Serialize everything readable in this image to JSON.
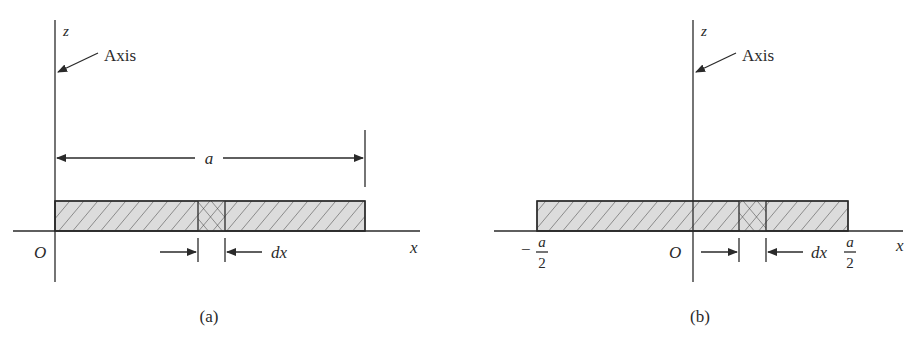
{
  "figure": {
    "panels": [
      {
        "id": "a",
        "caption": "(a)",
        "axis_callout": "Axis",
        "z_label": "z",
        "x_label": "x",
        "origin_label": "O",
        "length_label": "a",
        "element_label": "dx",
        "bar_extent": [
          "0",
          "a"
        ]
      },
      {
        "id": "b",
        "caption": "(b)",
        "axis_callout": "Axis",
        "z_label": "z",
        "x_label": "x",
        "origin_label": "O",
        "element_label": "dx",
        "left_end": {
          "sign": "−",
          "numerator": "a",
          "denominator": "2"
        },
        "right_end": {
          "numerator": "a",
          "denominator": "2"
        },
        "bar_extent": [
          "-a/2",
          "a/2"
        ]
      }
    ],
    "colors": {
      "line": "#2a2a2a",
      "bar_fill": "#dcdcdc",
      "background": "#ffffff"
    }
  }
}
